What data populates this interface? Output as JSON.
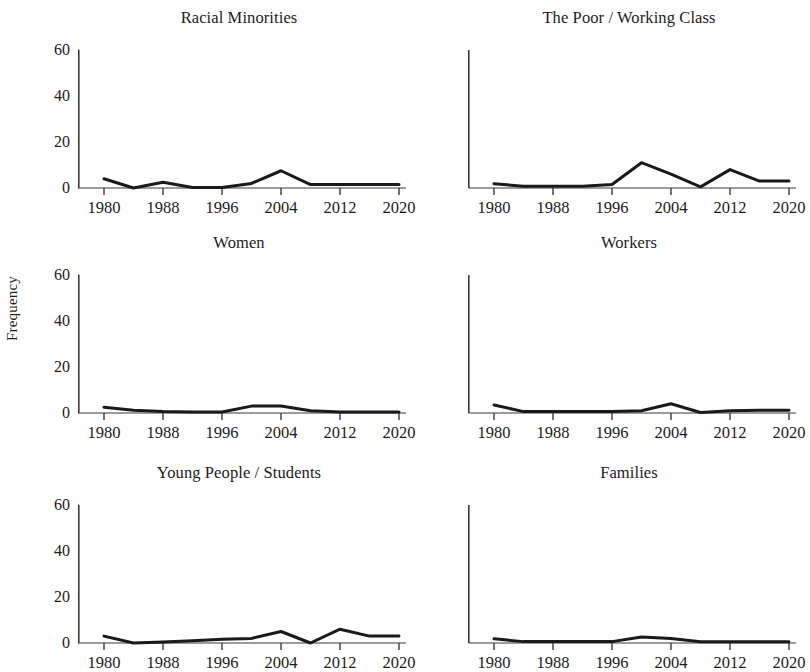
{
  "figure": {
    "ylabel": "Frequency",
    "y_ticks": [
      "60",
      "40",
      "20",
      "0"
    ],
    "x_ticks": [
      "1980",
      "1988",
      "1996",
      "2004",
      "2012",
      "2020"
    ],
    "line_color": "#1a1a1a",
    "axis_color": "#3a3a3a",
    "background": "#ffffff"
  },
  "chart_data": {
    "type": "line",
    "title": "",
    "subtitle": "",
    "xlabel": "",
    "ylabel": "Frequency",
    "xlim": [
      1980,
      2020
    ],
    "ylim": [
      0,
      60
    ],
    "grid": false,
    "legend": "none",
    "layout": {
      "rows": 3,
      "cols": 2,
      "shared_y_ticks_left_column_only": true
    },
    "x_tick_labels": [
      "1980",
      "1988",
      "1996",
      "2004",
      "2012",
      "2020"
    ],
    "y_tick_labels": [
      "0",
      "20",
      "40",
      "60"
    ],
    "x": [
      1980,
      1984,
      1988,
      1992,
      1996,
      2000,
      2004,
      2008,
      2012,
      2016,
      2020
    ],
    "panels": [
      {
        "title": "Racial Minorities",
        "row": 0,
        "col": 0,
        "values": [
          4,
          0,
          2.5,
          0.2,
          0.2,
          2,
          7.5,
          1.5,
          1.5,
          1.5,
          1.5
        ]
      },
      {
        "title": "The Poor / Working Class",
        "row": 0,
        "col": 1,
        "values": [
          1.8,
          0.8,
          0.8,
          0.8,
          1.5,
          11,
          6,
          0.5,
          8,
          3,
          3
        ]
      },
      {
        "title": "Women",
        "row": 1,
        "col": 0,
        "values": [
          2.5,
          1.2,
          0.6,
          0.4,
          0.4,
          3,
          3,
          1,
          0.4,
          0.4,
          0.4
        ]
      },
      {
        "title": "Workers",
        "row": 1,
        "col": 1,
        "values": [
          3.5,
          0.6,
          0.6,
          0.6,
          0.6,
          1,
          4,
          0.2,
          1,
          1.2,
          1.2
        ]
      },
      {
        "title": "Young People / Students",
        "row": 2,
        "col": 0,
        "values": [
          3,
          0,
          0.4,
          1,
          1.6,
          2,
          5,
          0,
          6,
          3,
          3
        ]
      },
      {
        "title": "Families",
        "row": 2,
        "col": 1,
        "values": [
          1.8,
          0.6,
          0.6,
          0.6,
          0.6,
          2.6,
          2,
          0.5,
          0.5,
          0.5,
          0.5
        ]
      }
    ]
  }
}
